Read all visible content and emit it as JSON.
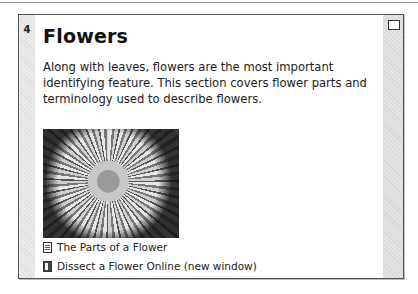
{
  "section": {
    "number": "4",
    "title": "Flowers",
    "summary": " Along with leaves, flowers are the most important identifying feature. This section covers flower parts and terminology used to describe flowers.",
    "image": {
      "alt": "dandelion flower photo"
    },
    "resources": [
      {
        "icon": "document-icon",
        "label": "The Parts of a Flower"
      },
      {
        "icon": "url-link-icon",
        "label": "Dissect a Flower Online (new window)"
      }
    ]
  }
}
